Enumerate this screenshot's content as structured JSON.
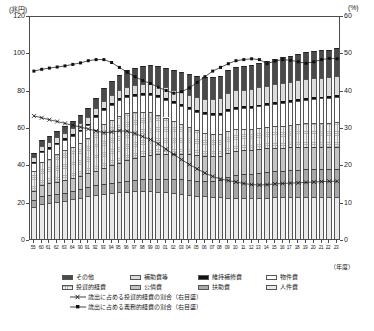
{
  "axes": {
    "left_unit": "(兆円)",
    "right_unit": "(%)",
    "left_ticks": [
      "120",
      "100",
      "80",
      "60",
      "40",
      "20",
      "0"
    ],
    "right_ticks": [
      "60",
      "50",
      "40",
      "30",
      "20",
      "10",
      "0"
    ],
    "x_axis_caption": "（年度）"
  },
  "legend": {
    "bars": [
      {
        "label": "その他",
        "swatch": "dark-gray"
      },
      {
        "label": "補助費等",
        "swatch": "light-gray"
      },
      {
        "label": "維持補修費",
        "swatch": "black"
      },
      {
        "label": "物件費",
        "swatch": "white"
      },
      {
        "label": "投資的経費",
        "swatch": "cross-hatch"
      },
      {
        "label": "公債費",
        "swatch": "mid-gray"
      },
      {
        "label": "扶助費",
        "swatch": "gray"
      },
      {
        "label": "人件費",
        "swatch": "dotted"
      }
    ],
    "lines": [
      {
        "label": "歳出に占める投資的経費の割合（右目盛）",
        "marker": "cross"
      },
      {
        "label": "歳出に占める義務的経費の割合（右目盛）",
        "marker": "square"
      }
    ]
  },
  "chart_data": {
    "type": "bar",
    "title": "",
    "xlabel": "（年度）",
    "ylabel": "兆円",
    "ylim": [
      0,
      120
    ],
    "y2lim": [
      0,
      60
    ],
    "grid": false,
    "legend_position": "bottom",
    "categories": [
      "55",
      "60",
      "61",
      "62",
      "63",
      "元",
      "2",
      "3",
      "4",
      "5",
      "6",
      "7",
      "8",
      "9",
      "10",
      "11",
      "12",
      "13",
      "14",
      "15",
      "16",
      "17",
      "18",
      "19",
      "20",
      "21",
      "22",
      "23",
      "24",
      "25",
      "26",
      "27",
      "28",
      "29",
      "30",
      "元",
      "2",
      "3",
      "4",
      "5"
    ],
    "tick_labels": [
      "55",
      "60",
      "61",
      "62",
      "63",
      "元",
      "2",
      "3",
      "4",
      "5",
      "6",
      "7",
      "8",
      "9",
      "10",
      "11",
      "12",
      "13",
      "14",
      "15",
      "16",
      "17",
      "18",
      "19",
      "20",
      "21",
      "22",
      "23",
      "24",
      "25",
      "26",
      "27",
      "28",
      "29",
      "30",
      "元",
      "2",
      "3",
      "4",
      "5"
    ],
    "display_labels": [
      "55",
      "60",
      "61",
      "62",
      "63",
      "64",
      "90",
      "91",
      "92",
      "93",
      "94",
      "95",
      "96",
      "97",
      "98",
      "99",
      "00",
      "01",
      "02",
      "03",
      "04",
      "05",
      "06",
      "07",
      "08",
      "09",
      "10",
      "11",
      "12",
      "13",
      "14",
      "15",
      "16",
      "17",
      "18",
      "19",
      "20",
      "21",
      "22",
      "23"
    ],
    "series": [
      {
        "name": "人件費",
        "values": [
          17.2,
          18.9,
          19.4,
          19.9,
          20.5,
          21.2,
          22.0,
          22.9,
          23.7,
          24.3,
          24.8,
          25.2,
          25.4,
          25.6,
          25.7,
          25.6,
          25.4,
          25.1,
          24.7,
          24.3,
          23.8,
          23.3,
          22.8,
          22.5,
          22.3,
          22.2,
          22.1,
          22.0,
          21.9,
          22.0,
          22.2,
          22.3,
          22.4,
          22.5,
          22.6,
          22.6,
          22.5,
          22.4,
          22.3,
          22.3
        ]
      },
      {
        "name": "扶助費",
        "values": [
          3.8,
          4.1,
          4.2,
          4.3,
          4.4,
          4.5,
          4.6,
          4.8,
          5.0,
          5.2,
          5.4,
          5.6,
          5.8,
          6.0,
          6.3,
          6.5,
          6.8,
          7.0,
          7.3,
          7.6,
          7.8,
          8.0,
          8.3,
          8.7,
          9.4,
          10.8,
          12.0,
          12.6,
          13.0,
          13.3,
          13.6,
          13.9,
          14.1,
          14.3,
          14.5,
          14.7,
          14.9,
          15.0,
          15.1,
          15.2
        ]
      },
      {
        "name": "公債費",
        "values": [
          4.6,
          6.0,
          6.3,
          6.6,
          6.8,
          7.0,
          7.3,
          7.6,
          8.0,
          8.6,
          9.3,
          10.1,
          10.9,
          11.7,
          12.4,
          12.9,
          13.3,
          13.5,
          13.6,
          13.7,
          13.8,
          13.7,
          13.5,
          13.2,
          13.0,
          12.9,
          12.9,
          12.9,
          12.8,
          12.8,
          12.7,
          12.6,
          12.5,
          12.4,
          12.3,
          12.2,
          12.1,
          12.0,
          11.9,
          11.9
        ]
      },
      {
        "name": "投資的経費",
        "values": [
          11.0,
          12.4,
          13.2,
          14.6,
          15.8,
          16.6,
          17.6,
          19.0,
          21.5,
          23.6,
          24.5,
          25.2,
          25.4,
          24.6,
          23.8,
          22.8,
          21.2,
          19.5,
          17.8,
          16.2,
          14.6,
          13.3,
          12.4,
          11.8,
          11.6,
          12.0,
          11.8,
          11.3,
          11.0,
          11.3,
          11.5,
          11.6,
          11.8,
          12.0,
          12.2,
          12.4,
          12.6,
          12.8,
          13.0,
          13.2
        ]
      },
      {
        "name": "物件費",
        "values": [
          4.2,
          5.0,
          5.2,
          5.4,
          5.6,
          5.9,
          6.2,
          6.6,
          7.0,
          7.4,
          7.8,
          8.2,
          8.5,
          8.8,
          9.0,
          9.2,
          9.4,
          9.5,
          9.6,
          9.7,
          9.8,
          9.9,
          10.0,
          10.2,
          10.4,
          10.7,
          11.0,
          11.2,
          11.4,
          11.6,
          11.8,
          12.0,
          12.2,
          12.4,
          12.6,
          12.8,
          13.0,
          13.1,
          13.2,
          13.3
        ]
      },
      {
        "name": "維持補修費",
        "values": [
          0.7,
          0.8,
          0.8,
          0.8,
          0.8,
          0.9,
          0.9,
          0.9,
          1.0,
          1.0,
          1.0,
          1.0,
          1.0,
          1.0,
          1.0,
          1.0,
          1.0,
          1.0,
          1.0,
          1.0,
          1.0,
          1.0,
          1.0,
          1.0,
          1.0,
          1.0,
          1.0,
          1.0,
          1.0,
          1.0,
          1.0,
          1.0,
          1.0,
          1.0,
          1.0,
          1.0,
          1.0,
          1.0,
          1.0,
          1.0
        ]
      },
      {
        "name": "補助費等",
        "values": [
          2.4,
          2.8,
          2.9,
          3.0,
          3.1,
          3.2,
          3.4,
          3.6,
          3.8,
          4.0,
          4.2,
          4.5,
          4.7,
          4.9,
          5.1,
          5.3,
          5.5,
          5.7,
          6.0,
          6.3,
          6.6,
          6.9,
          7.2,
          7.6,
          8.0,
          8.4,
          8.8,
          9.0,
          9.2,
          9.3,
          9.4,
          9.5,
          9.6,
          9.7,
          9.8,
          9.9,
          10.0,
          10.1,
          10.2,
          10.3
        ]
      },
      {
        "name": "その他",
        "values": [
          2.1,
          3.0,
          3.2,
          3.4,
          3.6,
          4.0,
          4.4,
          5.0,
          5.8,
          6.6,
          7.4,
          8.2,
          8.8,
          9.2,
          9.6,
          10.0,
          10.2,
          10.4,
          10.6,
          10.8,
          11.0,
          11.2,
          11.4,
          11.6,
          11.9,
          12.3,
          12.6,
          12.8,
          13.0,
          13.2,
          13.4,
          13.6,
          13.8,
          14.0,
          14.2,
          14.4,
          14.6,
          14.7,
          14.8,
          14.9
        ]
      }
    ],
    "line_series": [
      {
        "name": "歳出に占める投資的経費の割合（右目盛）",
        "axis": "right",
        "marker": "cross",
        "values": [
          33.5,
          33.0,
          32.5,
          32.0,
          31.5,
          31.0,
          30.5,
          30.0,
          29.5,
          29.0,
          29.2,
          29.5,
          29.4,
          28.8,
          28.0,
          27.2,
          26.0,
          24.6,
          23.2,
          21.8,
          20.5,
          19.3,
          18.2,
          17.3,
          16.6,
          16.2,
          15.8,
          15.4,
          15.1,
          15.0,
          15.1,
          15.3,
          15.4,
          15.5,
          15.6,
          15.7,
          15.8,
          15.9,
          16.0,
          16.0
        ]
      },
      {
        "name": "歳出に占める義務的経費の割合（右目盛）",
        "axis": "right",
        "marker": "square",
        "values": [
          45.5,
          46.0,
          46.3,
          46.6,
          46.9,
          47.3,
          47.7,
          48.3,
          48.6,
          48.6,
          47.8,
          46.5,
          45.2,
          44.0,
          43.0,
          42.2,
          41.2,
          40.3,
          39.6,
          40.0,
          41.0,
          42.5,
          44.0,
          45.5,
          46.5,
          47.5,
          48.3,
          48.6,
          48.8,
          48.6,
          47.5,
          48.2,
          48.6,
          48.4,
          48.0,
          47.6,
          48.0,
          48.6,
          48.9,
          48.8
        ]
      }
    ]
  }
}
